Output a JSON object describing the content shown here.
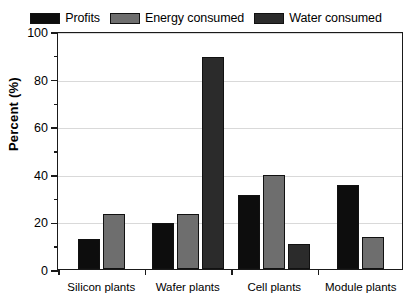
{
  "chart_data": {
    "type": "bar",
    "title": "",
    "xlabel": "",
    "ylabel": "Percent (%)",
    "ylim": [
      0,
      100
    ],
    "ytick_step": 20,
    "yminor_step": 10,
    "grid": true,
    "legend_position": "top-center",
    "categories": [
      "Silicon plants",
      "Wafer plants",
      "Cell plants",
      "Module plants"
    ],
    "ytick_labels": [
      "0",
      "20",
      "40",
      "60",
      "80",
      "100"
    ],
    "series": [
      {
        "name": "Profits",
        "color": "#0d0d0d",
        "values": [
          12.5,
          19.5,
          31.0,
          35.5
        ]
      },
      {
        "name": "Energy consumed",
        "color": "#6e6e6e",
        "values": [
          23.0,
          23.0,
          39.5,
          13.5
        ]
      },
      {
        "name": "Water consumed",
        "color": "#2b2b2b",
        "values": [
          null,
          89.0,
          10.5,
          null
        ]
      }
    ]
  }
}
